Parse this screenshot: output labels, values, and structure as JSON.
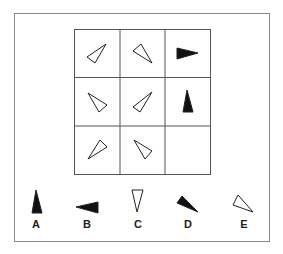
{
  "puzzle": {
    "type": "3x3 matrix reasoning",
    "grid": {
      "rows": 3,
      "cols": 3,
      "cells": [
        {
          "row": 0,
          "col": 0,
          "shape": "triangle",
          "fill": "outline",
          "points": [
            [
              87,
              57
            ],
            [
              106,
              44
            ],
            [
              95,
              63
            ]
          ]
        },
        {
          "row": 0,
          "col": 1,
          "shape": "triangle",
          "fill": "outline",
          "points": [
            [
              133,
              51
            ],
            [
              141,
              44
            ],
            [
              152,
              63
            ]
          ]
        },
        {
          "row": 0,
          "col": 2,
          "shape": "triangle",
          "fill": "solid",
          "points": [
            [
              177,
              48
            ],
            [
              198,
              53
            ],
            [
              177,
              59
            ]
          ]
        },
        {
          "row": 1,
          "col": 0,
          "shape": "triangle",
          "fill": "outline",
          "points": [
            [
              88,
              93
            ],
            [
              107,
              105
            ],
            [
              99,
              112
            ]
          ]
        },
        {
          "row": 1,
          "col": 1,
          "shape": "triangle",
          "fill": "outline",
          "points": [
            [
              152,
              92
            ],
            [
              133,
              107
            ],
            [
              140,
              112
            ]
          ]
        },
        {
          "row": 1,
          "col": 2,
          "shape": "triangle",
          "fill": "solid",
          "points": [
            [
              187,
              90
            ],
            [
              183,
              112
            ],
            [
              193,
              112
            ]
          ]
        },
        {
          "row": 2,
          "col": 0,
          "shape": "triangle",
          "fill": "outline",
          "points": [
            [
              88,
              159
            ],
            [
              100,
              140
            ],
            [
              107,
              147
            ]
          ]
        },
        {
          "row": 2,
          "col": 1,
          "shape": "triangle",
          "fill": "outline",
          "points": [
            [
              134,
              140
            ],
            [
              152,
              151
            ],
            [
              145,
              159
            ]
          ]
        },
        {
          "row": 2,
          "col": 2,
          "shape": "empty",
          "fill": "none",
          "points": []
        }
      ]
    },
    "options": [
      {
        "label": "A",
        "fill": "solid",
        "points": [
          [
            36,
            190
          ],
          [
            32,
            213
          ],
          [
            42,
            213
          ]
        ],
        "label_x": 36
      },
      {
        "label": "B",
        "fill": "solid",
        "points": [
          [
            76,
            207
          ],
          [
            98,
            202
          ],
          [
            98,
            213
          ]
        ],
        "label_x": 87
      },
      {
        "label": "C",
        "fill": "outline",
        "points": [
          [
            132,
            190
          ],
          [
            143,
            190
          ],
          [
            137,
            212
          ]
        ],
        "label_x": 138
      },
      {
        "label": "D",
        "fill": "solid",
        "points": [
          [
            182,
            196
          ],
          [
            177,
            203
          ],
          [
            198,
            212
          ]
        ],
        "label_x": 188
      },
      {
        "label": "E",
        "fill": "outline",
        "points": [
          [
            238,
            195
          ],
          [
            233,
            205
          ],
          [
            253,
            212
          ]
        ],
        "label_x": 244
      }
    ],
    "colors": {
      "stroke": "#222222",
      "fill": "#111111",
      "grid": "#555555",
      "frame": "#8a8a8a"
    }
  }
}
